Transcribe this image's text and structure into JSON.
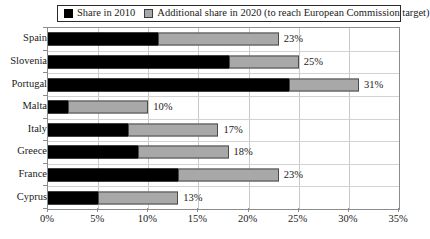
{
  "chart_data": {
    "type": "bar",
    "orientation": "horizontal",
    "stacked": true,
    "title": "",
    "xlabel": "",
    "ylabel": "",
    "xlim": [
      0,
      35
    ],
    "xtick_labels": [
      "0%",
      "5%",
      "10%",
      "15%",
      "20%",
      "25%",
      "30%",
      "35%"
    ],
    "xticks": [
      0,
      5,
      10,
      15,
      20,
      25,
      30,
      35
    ],
    "grid": true,
    "legend_position": "top",
    "categories": [
      "Spain",
      "Slovenia",
      "Portugal",
      "Malta",
      "Italy",
      "Greece",
      "France",
      "Cyprus"
    ],
    "series": [
      {
        "name": "Share in 2010",
        "color": "#000000",
        "values": [
          11,
          18,
          24,
          2,
          8,
          9,
          13,
          5
        ]
      },
      {
        "name": "Additional share in 2020 (to reach European Commission target)",
        "color": "#a8a8a8",
        "values": [
          12,
          7,
          7,
          8,
          9,
          9,
          10,
          8
        ]
      }
    ],
    "totals": [
      23,
      25,
      31,
      10,
      17,
      18,
      23,
      13
    ],
    "data_labels": [
      "23%",
      "25%",
      "31%",
      "10%",
      "17%",
      "18%",
      "23%",
      "13%"
    ]
  },
  "legend": {
    "entries": [
      {
        "label": "Share in 2010"
      },
      {
        "label": "Additional share in 2020 (to reach European Commission target)"
      }
    ]
  }
}
